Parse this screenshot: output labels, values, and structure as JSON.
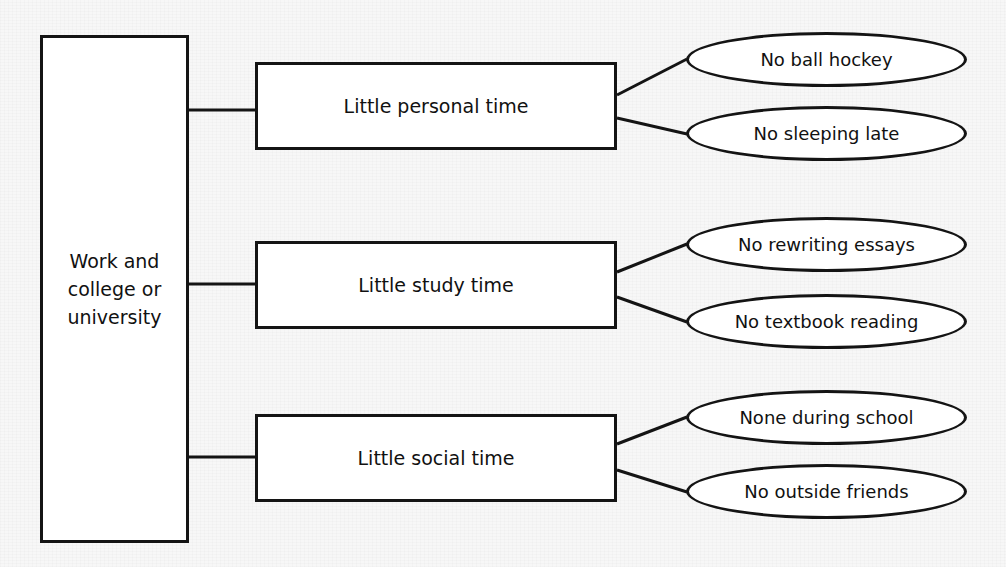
{
  "diagram": {
    "type": "tree-diagram",
    "background_color": "#f7f7f7",
    "line_color": "#141414",
    "node_fill": "#ffffff",
    "root": {
      "label": "Work and\ncollege or\nuniversity"
    },
    "branches": [
      {
        "label": "Little personal time",
        "leaves": [
          {
            "label": "No ball hockey"
          },
          {
            "label": "No sleeping late"
          }
        ]
      },
      {
        "label": "Little study time",
        "leaves": [
          {
            "label": "No rewriting essays"
          },
          {
            "label": "No textbook reading"
          }
        ]
      },
      {
        "label": "Little social time",
        "leaves": [
          {
            "label": "None during school"
          },
          {
            "label": "No outside friends"
          }
        ]
      }
    ]
  },
  "geometry": {
    "root": {
      "x": 40,
      "y": 35,
      "w": 149,
      "h": 508
    },
    "branches": [
      {
        "x": 255,
        "y": 62,
        "w": 362,
        "h": 88
      },
      {
        "x": 255,
        "y": 241,
        "w": 362,
        "h": 88
      },
      {
        "x": 255,
        "y": 414,
        "w": 362,
        "h": 88
      }
    ],
    "leaves": [
      {
        "x": 686,
        "y": 32,
        "w": 281,
        "h": 55
      },
      {
        "x": 686,
        "y": 106,
        "w": 281,
        "h": 55
      },
      {
        "x": 686,
        "y": 217,
        "w": 281,
        "h": 55
      },
      {
        "x": 686,
        "y": 294,
        "w": 281,
        "h": 55
      },
      {
        "x": 686,
        "y": 390,
        "w": 281,
        "h": 55
      },
      {
        "x": 686,
        "y": 464,
        "w": 281,
        "h": 55
      }
    ],
    "edges": [
      {
        "kind": "trunk-to-branch",
        "x1": 189,
        "y1": 110,
        "x2": 256,
        "y2": 110
      },
      {
        "kind": "trunk-to-branch",
        "x1": 189,
        "y1": 284,
        "x2": 256,
        "y2": 284
      },
      {
        "kind": "trunk-to-branch",
        "x1": 189,
        "y1": 457,
        "x2": 256,
        "y2": 457
      },
      {
        "kind": "branch-to-leaf",
        "x1": 617,
        "y1": 95,
        "x2": 687,
        "y2": 59
      },
      {
        "kind": "branch-to-leaf",
        "x1": 617,
        "y1": 118,
        "x2": 687,
        "y2": 134
      },
      {
        "kind": "branch-to-leaf",
        "x1": 617,
        "y1": 272,
        "x2": 687,
        "y2": 244
      },
      {
        "kind": "branch-to-leaf",
        "x1": 617,
        "y1": 297,
        "x2": 687,
        "y2": 322
      },
      {
        "kind": "branch-to-leaf",
        "x1": 617,
        "y1": 444,
        "x2": 687,
        "y2": 417
      },
      {
        "kind": "branch-to-leaf",
        "x1": 617,
        "y1": 470,
        "x2": 687,
        "y2": 492
      }
    ]
  }
}
